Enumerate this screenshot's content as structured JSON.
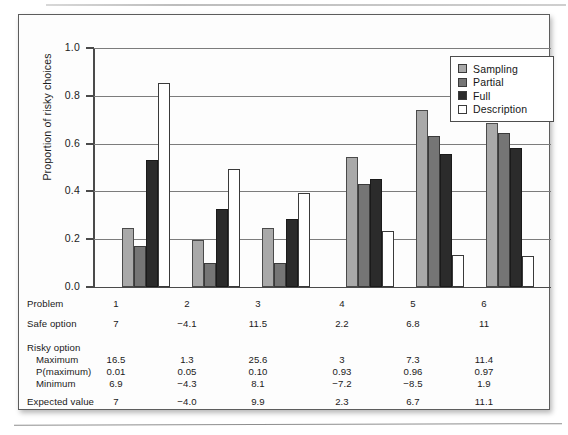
{
  "figure": {
    "y_axis_title": "Proportion of risky choices",
    "y_ticks": [
      "1.0",
      "0.8",
      "0.6",
      "0.4",
      "0.2",
      "0.0"
    ]
  },
  "legend": {
    "items": [
      {
        "label": "Sampling",
        "swatch": "sampling",
        "color": "#a9a9a9"
      },
      {
        "label": "Partial",
        "swatch": "partial",
        "color": "#757575"
      },
      {
        "label": "Full",
        "swatch": "full",
        "color": "#2b2b2b"
      },
      {
        "label": "Description",
        "swatch": "description",
        "color": "#ffffff"
      }
    ]
  },
  "table": {
    "rows": [
      {
        "label": "Problem",
        "indent": false,
        "values": [
          "1",
          "2",
          "3",
          "4",
          "5",
          "6"
        ]
      },
      {
        "label": "Safe option",
        "indent": false,
        "values": [
          "7",
          "−4.1",
          "11.5",
          "2.2",
          "6.8",
          "11"
        ]
      },
      {
        "label": "Risky option",
        "indent": false,
        "values": [
          "",
          "",
          "",
          "",
          "",
          ""
        ]
      },
      {
        "label": "Maximum",
        "indent": true,
        "values": [
          "16.5",
          "1.3",
          "25.6",
          "3",
          "7.3",
          "11.4"
        ]
      },
      {
        "label": "P(maximum)",
        "indent": true,
        "values": [
          "0.01",
          "0.05",
          "0.10",
          "0.93",
          "0.96",
          "0.97"
        ]
      },
      {
        "label": "Minimum",
        "indent": true,
        "values": [
          "6.9",
          "−4.3",
          "8.1",
          "−7.2",
          "−8.5",
          "1.9"
        ]
      },
      {
        "label": "Expected value",
        "indent": false,
        "values": [
          "7",
          "−4.0",
          "9.9",
          "2.3",
          "6.7",
          "11.1"
        ]
      }
    ]
  },
  "chart_data": {
    "type": "bar",
    "title": "",
    "xlabel": "",
    "ylabel": "Proportion of risky choices",
    "ylim": [
      0.0,
      1.0
    ],
    "ytick_step": 0.2,
    "grid": true,
    "legend_position": "top-right",
    "categories": [
      "1",
      "2",
      "3",
      "4",
      "5",
      "6"
    ],
    "series": [
      {
        "name": "Sampling",
        "color": "#a9a9a9",
        "values": [
          0.245,
          0.195,
          0.245,
          0.545,
          0.74,
          0.685
        ]
      },
      {
        "name": "Partial",
        "color": "#757575",
        "values": [
          0.17,
          0.1,
          0.1,
          0.43,
          0.632,
          0.645
        ]
      },
      {
        "name": "Full",
        "color": "#2b2b2b",
        "values": [
          0.53,
          0.325,
          0.285,
          0.45,
          0.555,
          0.58
        ]
      },
      {
        "name": "Description",
        "color": "#ffffff",
        "values": [
          0.852,
          0.492,
          0.392,
          0.235,
          0.132,
          0.13
        ]
      }
    ]
  }
}
